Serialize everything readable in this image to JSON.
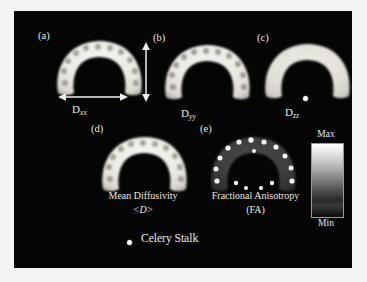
{
  "figure": {
    "title_caption": "Celery Stalk",
    "background_color": "#050505",
    "paper_color": "#f4f3f1",
    "text_color": "#e8e8e4"
  },
  "panels": [
    {
      "tag": "(a)",
      "map_label_base": "D",
      "map_label_sub": "xx",
      "image_name": "dti-dxx-map",
      "contrast": "bright-interior-dark-vascular-bundles",
      "annotation_arrow": "horizontal-double-headed"
    },
    {
      "tag": "(b)",
      "map_label_base": "D",
      "map_label_sub": "yy",
      "image_name": "dti-dyy-map",
      "contrast": "bright-interior-dark-vascular-bundles",
      "annotation_arrow": "vertical-double-headed"
    },
    {
      "tag": "(c)",
      "map_label_base": "D",
      "map_label_sub": "zz",
      "image_name": "dti-dzz-map",
      "contrast": "uniform-bright-interior",
      "annotation_arrow": "none"
    },
    {
      "tag": "(d)",
      "caption_line1": "Mean Diffusivity",
      "caption_line2": "<D>",
      "image_name": "mean-diffusivity-map",
      "contrast": "bright-interior-dark-vascular-bundles",
      "annotation_arrow": "none"
    },
    {
      "tag": "(e)",
      "caption_line1": "Fractional Anisotropy",
      "caption_line2": "(FA)",
      "image_name": "fractional-anisotropy-map",
      "contrast": "dark-interior-bright-vascular-bundles",
      "annotation_arrow": "none"
    }
  ],
  "colorbar": {
    "max_label": "Max",
    "min_label": "Min",
    "orientation": "vertical",
    "colormap": "grayscale",
    "top_color": "#ffffff",
    "bottom_color": "#0a0a0a"
  },
  "markers": {
    "reference_dot_panel_c": "fiducial-marker",
    "reference_dot_caption": "fiducial-marker"
  }
}
